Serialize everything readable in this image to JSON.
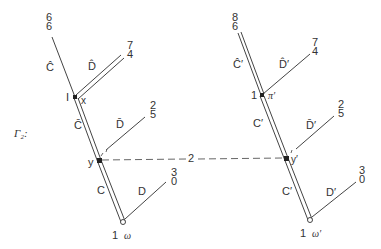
{
  "graph_label": "Γ₂:",
  "left": {
    "top_numbers": [
      "6",
      "6"
    ],
    "edge_c_hat": "Ĉ",
    "edge_d_hat": "D̂",
    "d_hat_numbers": [
      "7",
      "4"
    ],
    "node_x_left": "I",
    "node_x_right": "x",
    "edge_c_bar": "C̄",
    "edge_d_bar": "D̄",
    "d_bar_numbers": [
      "2",
      "5"
    ],
    "node_y": "y",
    "edge_c": "C",
    "edge_d": "D",
    "d_numbers": [
      "3",
      "0"
    ],
    "root_left": "1",
    "root_right": "ω"
  },
  "right": {
    "top_numbers": [
      "8",
      "6"
    ],
    "edge_c_hat": "Ĉ′",
    "edge_d_hat": "D̂′",
    "d_hat_numbers": [
      "7",
      "4"
    ],
    "node_pi_left": "1",
    "node_pi_right": "π′",
    "edge_c_bar": "C′",
    "edge_d_bar": "D̄′",
    "d_bar_numbers": [
      "2",
      "5"
    ],
    "node_y": "y′",
    "edge_c": "C′",
    "edge_d": "D′",
    "d_numbers": [
      "3",
      "0"
    ],
    "root_left": "1",
    "root_right": "ω′"
  },
  "connector_label": "2",
  "colors": {
    "line": "#444444",
    "text": "#333333"
  }
}
